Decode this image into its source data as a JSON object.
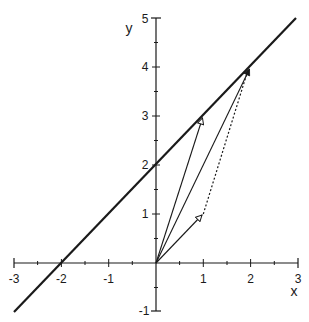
{
  "diagram": {
    "type": "coordinate-plane-vectors",
    "axes": {
      "x_label": "x",
      "y_label": "y",
      "x_range": [
        -3,
        3
      ],
      "y_range": [
        -1,
        5
      ],
      "x_ticks": [
        "-3",
        "-2",
        "-1",
        "1",
        "2",
        "3"
      ],
      "y_ticks": [
        "-1",
        "1",
        "2",
        "3",
        "4",
        "5"
      ],
      "minor_tick_step": 0.5
    },
    "line": {
      "equation": "y = x + 2",
      "from": [
        -3,
        -1
      ],
      "to": [
        2.95,
        4.95
      ],
      "style": "thick"
    },
    "vectors": [
      {
        "name": "u",
        "from": [
          0,
          0
        ],
        "to": [
          1,
          3
        ],
        "head": "open"
      },
      {
        "name": "v",
        "from": [
          0,
          0
        ],
        "to": [
          1,
          1
        ],
        "head": "open"
      },
      {
        "name": "sum",
        "from": [
          0,
          0
        ],
        "to": [
          2,
          4
        ],
        "head": "filled"
      },
      {
        "name": "dotted-translate",
        "from": [
          1,
          1
        ],
        "to": [
          2,
          4
        ],
        "style": "dotted"
      }
    ],
    "colors": {
      "ink": "#1a1a1a",
      "background": "#ffffff"
    }
  }
}
